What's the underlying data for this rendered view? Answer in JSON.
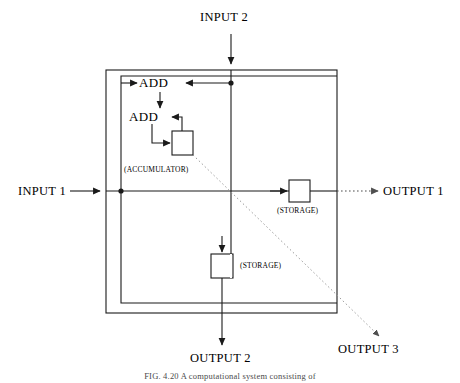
{
  "figure": {
    "title_visible": false,
    "caption": "FIG. 4.20   A computational system consisting of",
    "background_color": "#ffffff",
    "line_color": "#1a1a1a",
    "dotted_line_color": "#8a8a8a"
  },
  "labels": {
    "input1": "INPUT 1",
    "input2": "INPUT 2",
    "output1": "OUTPUT 1",
    "output2": "OUTPUT 2",
    "output3": "OUTPUT 3",
    "add_upper": "ADD",
    "add_lower": "ADD",
    "accumulator": "(ACCUMULATOR)",
    "storage_right": "(STORAGE)",
    "storage_bottom": "(STORAGE)"
  },
  "diagram": {
    "type": "dataflow-block-diagram",
    "outer_box": {
      "x": 106,
      "y": 70,
      "width": 231,
      "height": 243
    },
    "nodes": [
      {
        "name": "accumulator-box",
        "x": 172,
        "y": 131,
        "width": 21,
        "height": 24,
        "label": "(ACCUMULATOR)"
      },
      {
        "name": "storage-box-right",
        "x": 289,
        "y": 178,
        "width": 21,
        "height": 22,
        "label": "(STORAGE)"
      },
      {
        "name": "storage-box-bottom",
        "x": 211,
        "y": 254,
        "width": 22,
        "height": 24,
        "label": "(STORAGE)"
      }
    ],
    "ports": [
      {
        "name": "input-1",
        "side": "left",
        "x": 106,
        "y": 191
      },
      {
        "name": "input-2",
        "side": "top",
        "x": 231,
        "y": 70
      },
      {
        "name": "output-1",
        "side": "right",
        "x": 337,
        "y": 191
      },
      {
        "name": "output-2",
        "side": "bottom",
        "x": 222,
        "y": 313
      },
      {
        "name": "output-3",
        "side": "corner",
        "x": 337,
        "y": 313
      }
    ],
    "junctions": [
      {
        "name": "junction-input1",
        "x": 121,
        "y": 191
      },
      {
        "name": "junction-input2",
        "x": 231,
        "y": 83
      }
    ],
    "dotted_paths": [
      {
        "name": "accumulator-to-output3",
        "from": "accumulator-box",
        "to": "output-3"
      },
      {
        "name": "storage-right-to-output1",
        "from": "storage-box-right",
        "to": "output-1"
      }
    ]
  }
}
